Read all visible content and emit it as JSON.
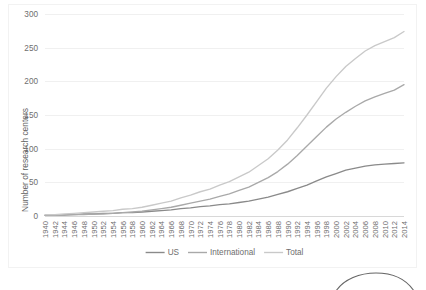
{
  "chart_data": {
    "type": "line",
    "title": "",
    "xlabel": "",
    "ylabel": "Number of research centers",
    "ylim": [
      0,
      300
    ],
    "yticks": [
      0,
      50,
      100,
      150,
      200,
      250,
      300
    ],
    "grid": true,
    "legend_position": "bottom",
    "categories": [
      "1940",
      "1942",
      "1944",
      "1946",
      "1948",
      "1950",
      "1952",
      "1954",
      "1956",
      "1958",
      "1960",
      "1962",
      "1964",
      "1966",
      "1968",
      "1970",
      "1972",
      "1974",
      "1976",
      "1978",
      "1980",
      "1982",
      "1984",
      "1986",
      "1988",
      "1990",
      "1992",
      "1994",
      "1996",
      "1998",
      "2000",
      "2002",
      "2004",
      "2006",
      "2008",
      "2010",
      "2012",
      "2014"
    ],
    "series": [
      {
        "name": "US",
        "color": "#8a8a8a",
        "values": [
          1,
          1,
          2,
          2,
          3,
          3,
          4,
          4,
          5,
          5,
          6,
          7,
          8,
          9,
          11,
          12,
          14,
          15,
          17,
          18,
          20,
          22,
          25,
          28,
          32,
          36,
          41,
          46,
          52,
          58,
          63,
          68,
          71,
          74,
          76,
          77,
          78,
          79
        ]
      },
      {
        "name": "International",
        "color": "#a9a9a9",
        "values": [
          1,
          1,
          1,
          2,
          2,
          3,
          3,
          4,
          5,
          6,
          7,
          9,
          11,
          13,
          16,
          19,
          22,
          25,
          29,
          33,
          38,
          43,
          50,
          57,
          66,
          77,
          90,
          104,
          118,
          132,
          144,
          154,
          163,
          171,
          177,
          182,
          187,
          195
        ]
      },
      {
        "name": "Total",
        "color": "#c9c9c9",
        "values": [
          2,
          2,
          3,
          4,
          5,
          6,
          7,
          8,
          10,
          11,
          13,
          16,
          19,
          22,
          27,
          31,
          36,
          40,
          46,
          51,
          58,
          65,
          75,
          85,
          98,
          113,
          131,
          150,
          170,
          190,
          207,
          222,
          234,
          245,
          253,
          259,
          265,
          274
        ]
      }
    ]
  },
  "legend": {
    "items": [
      {
        "label": "US"
      },
      {
        "label": "International"
      },
      {
        "label": "Total"
      }
    ]
  }
}
